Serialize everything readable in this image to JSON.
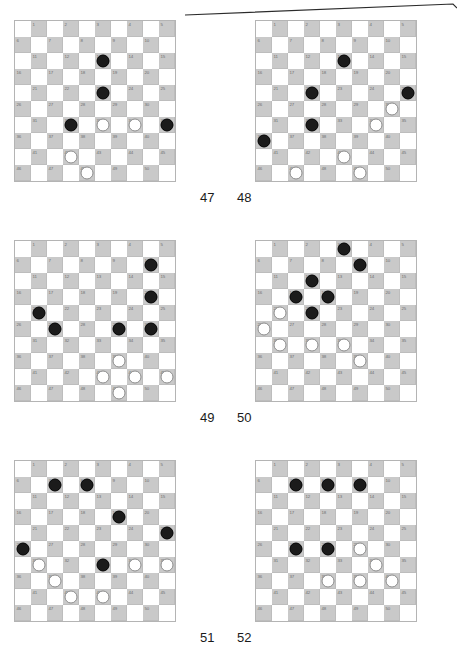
{
  "page": {
    "type": "draughts-puzzle-diagrams",
    "board_size": 10,
    "numbered_squares": 50,
    "colors": {
      "dark_square": "#c9c9c9",
      "light_square": "#ffffff",
      "black_piece": "#1b1b1b",
      "white_piece": "#ffffff",
      "piece_outline": "#8c8c8c",
      "board_border": "#b4b4b4",
      "square_number_text": "#6e6e6e",
      "label_text": "#1a1a1a"
    },
    "artifact": {
      "name": "scan-line",
      "description": "thin diagonal line across the top of the page"
    }
  },
  "diagrams": [
    {
      "label": "47",
      "position": "top-left",
      "black": [
        13,
        23,
        32,
        35
      ],
      "white": [
        33,
        34,
        42,
        48
      ]
    },
    {
      "label": "48",
      "position": "top-right",
      "black": [
        13,
        22,
        25,
        32,
        36
      ],
      "white": [
        30,
        34,
        43,
        47,
        49
      ]
    },
    {
      "label": "49",
      "position": "middle-left",
      "black": [
        10,
        20,
        21,
        27,
        29,
        30
      ],
      "white": [
        39,
        43,
        44,
        45,
        49
      ]
    },
    {
      "label": "50",
      "position": "middle-right",
      "black": [
        3,
        9,
        12,
        17,
        18,
        22
      ],
      "white": [
        21,
        26,
        31,
        32,
        33,
        39
      ]
    },
    {
      "label": "51",
      "position": "bottom-left",
      "black": [
        7,
        8,
        19,
        25,
        26,
        33
      ],
      "white": [
        31,
        34,
        35,
        37,
        42,
        43
      ]
    },
    {
      "label": "52",
      "position": "bottom-right",
      "black": [
        7,
        8,
        9,
        27,
        28
      ],
      "white": [
        29,
        34,
        38,
        39,
        40
      ]
    }
  ],
  "square_numbers": [
    1,
    2,
    3,
    4,
    5,
    6,
    7,
    8,
    9,
    10,
    11,
    12,
    13,
    14,
    15,
    16,
    17,
    18,
    19,
    20,
    21,
    22,
    23,
    24,
    25,
    26,
    27,
    28,
    29,
    30,
    31,
    32,
    33,
    34,
    35,
    36,
    37,
    38,
    39,
    40,
    41,
    42,
    43,
    44,
    45,
    46,
    47,
    48,
    49,
    50
  ]
}
